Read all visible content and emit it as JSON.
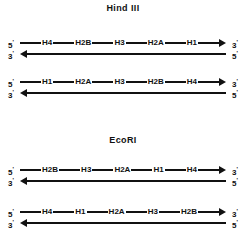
{
  "figure": {
    "background_color": "#ffffff",
    "ink_color": "#111111",
    "panels": [
      {
        "id": "hind3",
        "title": "Hind III",
        "duplexes": [
          {
            "id": "hind3-duplex-1",
            "top_strand": {
              "left_label": "5",
              "left_prime": "'",
              "right_label": "3",
              "right_prime": "'",
              "direction": "right",
              "genes": [
                "H4",
                "H2B",
                "H3",
                "H2A",
                "H1"
              ]
            },
            "bottom_strand": {
              "left_label": "3",
              "left_prime": "'",
              "right_label": "5",
              "right_prime": "'",
              "direction": "left",
              "genes": []
            }
          },
          {
            "id": "hind3-duplex-2",
            "top_strand": {
              "left_label": "5",
              "left_prime": "'",
              "right_label": "3",
              "right_prime": "'",
              "direction": "right",
              "genes": [
                "H1",
                "H2A",
                "H3",
                "H2B",
                "H4"
              ]
            },
            "bottom_strand": {
              "left_label": "3",
              "left_prime": "'",
              "right_label": "5",
              "right_prime": "'",
              "direction": "left",
              "genes": []
            }
          }
        ]
      },
      {
        "id": "ecori",
        "title": "EcoRI",
        "duplexes": [
          {
            "id": "ecori-duplex-1",
            "top_strand": {
              "left_label": "5",
              "left_prime": "'",
              "right_label": "3",
              "right_prime": "'",
              "direction": "right",
              "genes": [
                "H2B",
                "H3",
                "H2A",
                "H1",
                "H4"
              ]
            },
            "bottom_strand": {
              "left_label": "3",
              "left_prime": "'",
              "right_label": "5",
              "right_prime": "'",
              "direction": "left",
              "genes": []
            }
          },
          {
            "id": "ecori-duplex-2",
            "top_strand": {
              "left_label": "5",
              "left_prime": "'",
              "right_label": "3",
              "right_prime": "'",
              "direction": "right",
              "genes": [
                "H4",
                "H1",
                "H2A",
                "H3",
                "H2B"
              ]
            },
            "bottom_strand": {
              "left_label": "3",
              "left_prime": "'",
              "right_label": "5",
              "right_prime": "'",
              "direction": "left",
              "genes": []
            }
          }
        ]
      }
    ]
  }
}
